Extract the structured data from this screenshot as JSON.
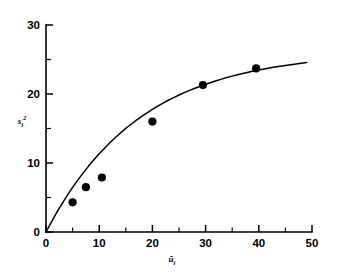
{
  "figure": {
    "background_color": "#ffffff",
    "ink_color": "#000000"
  },
  "chart_data": {
    "type": "scatter",
    "title": "",
    "subtitle": "",
    "xlabel": "ū",
    "xlabel_base": "ū",
    "xlabel_sub": "i",
    "ylabel": "s",
    "ylabel_base": "s",
    "ylabel_sub": "i",
    "ylabel_sup": "2",
    "xlim": [
      0,
      50
    ],
    "ylim": [
      0,
      30
    ],
    "xticks": [
      0,
      10,
      20,
      30,
      40,
      50
    ],
    "xticklabels": [
      "0",
      "10",
      "20",
      "30",
      "40",
      "50"
    ],
    "xminorticks": [
      5,
      15,
      25,
      35,
      45
    ],
    "yticks": [
      0,
      10,
      20,
      30
    ],
    "yticklabels": [
      "0",
      "10",
      "20",
      "30"
    ],
    "yminorticks": [
      5,
      15,
      25
    ],
    "grid": false,
    "legend": null,
    "marker": "filled-circle",
    "marker_color": "#000000",
    "curve_color": "#000000",
    "x": [
      5.0,
      7.5,
      10.5,
      20.0,
      29.5,
      39.5
    ],
    "y": [
      4.3,
      6.5,
      7.9,
      16.0,
      21.3,
      23.7
    ],
    "points": [
      {
        "x": 5.0,
        "y": 4.3
      },
      {
        "x": 7.5,
        "y": 6.5
      },
      {
        "x": 10.5,
        "y": 7.9
      },
      {
        "x": 20.0,
        "y": 16.0
      },
      {
        "x": 29.5,
        "y": 21.3
      },
      {
        "x": 39.5,
        "y": 23.7
      }
    ],
    "fit_curve": {
      "name": "saturating fit",
      "x_start": 0,
      "x_end": 49,
      "y_start": 0,
      "y_end": 24.8,
      "asymptote": 25.6,
      "rate": 0.058,
      "x_series": [
        0,
        1,
        2,
        3,
        4,
        5,
        6,
        7,
        8,
        9,
        10,
        11,
        12,
        13,
        14,
        15,
        16,
        17,
        18,
        19,
        20,
        21,
        22,
        23,
        24,
        25,
        26,
        27,
        28,
        29,
        30,
        31,
        32,
        33,
        34,
        35,
        36,
        37,
        38,
        39,
        40,
        41,
        42,
        43,
        44,
        45,
        46,
        47,
        48,
        49
      ],
      "y_series": [
        0,
        1.44,
        2.8,
        4.09,
        5.31,
        6.46,
        7.55,
        8.57,
        9.55,
        10.46,
        11.33,
        12.15,
        12.93,
        13.66,
        14.35,
        15.01,
        15.62,
        16.21,
        16.76,
        17.28,
        17.77,
        18.23,
        18.67,
        19.09,
        19.48,
        19.85,
        20.2,
        20.53,
        20.84,
        21.13,
        21.41,
        21.67,
        21.92,
        22.16,
        22.38,
        22.59,
        22.79,
        22.97,
        23.15,
        23.32,
        23.47,
        23.62,
        23.76,
        23.9,
        24.02,
        24.14,
        24.25,
        24.36,
        24.46,
        24.56
      ]
    }
  }
}
